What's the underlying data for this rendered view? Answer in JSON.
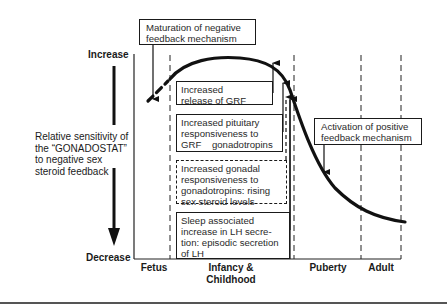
{
  "diagram": {
    "y_axis": {
      "top_label": "Increase",
      "bottom_label": "Decrease",
      "title_lines": [
        "Relative sensitivity of",
        "the “GONADOSTAT”",
        "to negative sex",
        "steroid feedback"
      ]
    },
    "x_axis": {
      "stages": [
        {
          "label": "Fetus"
        },
        {
          "label": "Infancy &",
          "label2": "Childhood"
        },
        {
          "label": "Puberty"
        },
        {
          "label": "Adult"
        }
      ]
    },
    "callouts": {
      "maturation": [
        "Maturation of negative",
        "feedback mechanism"
      ],
      "activation": [
        "Activation of positive",
        "feedback mechanism"
      ]
    },
    "boxes": [
      {
        "lines": [
          "Increased",
          "release of GRF"
        ],
        "style": "solid"
      },
      {
        "lines": [
          "Increased pituitary",
          "responsiveness to",
          "GRF    gonadotropins"
        ],
        "style": "solid"
      },
      {
        "lines": [
          "Increased gonadal",
          "responsiveness to",
          "gonadotropins: rising",
          "sex steroid levels"
        ],
        "style": "dashed"
      },
      {
        "lines": [
          "Sleep associated",
          "increase in LH secre-",
          "tion: episodic secretion",
          "of LH"
        ],
        "style": "solid"
      }
    ],
    "curve": {
      "description": "Sensitivity rises from fetus, peaks in infancy/childhood, declines sharply through puberty, levels low in adulthood",
      "line_color": "#111111"
    }
  }
}
